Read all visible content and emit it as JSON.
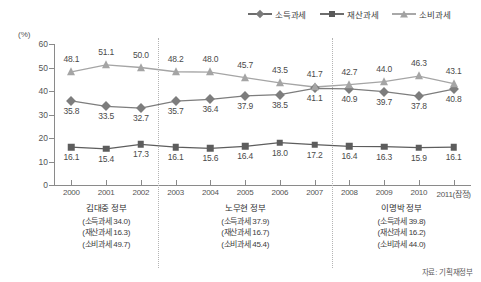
{
  "chart_data": {
    "type": "line",
    "title": "",
    "subtitle": "",
    "xlabel": "",
    "ylabel": "",
    "unit_label": "(%)",
    "ylim": [
      0,
      60
    ],
    "yticks": [
      0,
      10,
      20,
      30,
      40,
      50,
      60
    ],
    "grid": false,
    "legend_position": "top-right",
    "categories": [
      "2000",
      "2001",
      "2002",
      "2003",
      "2004",
      "2005",
      "2006",
      "2007",
      "2008",
      "2009",
      "2010",
      "2011(잠정)"
    ],
    "series": [
      {
        "name": "소득과세",
        "marker": "diamond",
        "color": "#7d7d7d",
        "values": [
          35.8,
          33.5,
          32.7,
          35.7,
          36.4,
          37.9,
          38.5,
          41.1,
          40.9,
          39.7,
          37.8,
          40.8
        ],
        "label_position": "below"
      },
      {
        "name": "재산과세",
        "marker": "square",
        "color": "#5d5d5d",
        "values": [
          16.1,
          15.4,
          17.3,
          16.1,
          15.6,
          16.4,
          18.0,
          17.2,
          16.4,
          16.3,
          15.9,
          16.1
        ],
        "label_position": "below"
      },
      {
        "name": "소비과세",
        "marker": "triangle",
        "color": "#a5a5a5",
        "values": [
          48.1,
          51.1,
          50.0,
          48.2,
          48.0,
          45.7,
          43.5,
          41.7,
          42.7,
          44.0,
          46.3,
          43.1
        ],
        "label_position": "above"
      }
    ],
    "dividers": [
      {
        "after_category": "2002"
      },
      {
        "after_category": "2007"
      }
    ],
    "annotations": [
      {
        "title": "김대중 정부",
        "lines": [
          "(소득과세 34.0)",
          "(재산과세 16.3)",
          "(소비과세 49.7)"
        ],
        "span": [
          "2000",
          "2002"
        ]
      },
      {
        "title": "노무현 정부",
        "lines": [
          "(소득과세 37.9)",
          "(재산과세 16.7)",
          "(소비과세 45.4)"
        ],
        "span": [
          "2003",
          "2007"
        ]
      },
      {
        "title": "이명박 정부",
        "lines": [
          "(소득과세 39.8)",
          "(재산과세 16.2)",
          "(소비과세 44.0)"
        ],
        "span": [
          "2008",
          "2011(잠정)"
        ]
      }
    ],
    "source": "자료: 기획재정부"
  }
}
